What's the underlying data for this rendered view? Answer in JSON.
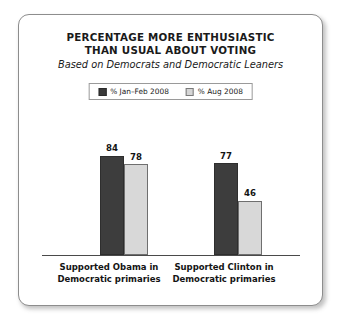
{
  "card": {
    "border_color": "#8d8d8d",
    "background": "#ffffff"
  },
  "title": {
    "line1": "PERCENTAGE MORE ENTHUSIASTIC",
    "line2": "THAN USUAL ABOUT VOTING",
    "subtitle": "Based on Democrats and Democratic Leaners"
  },
  "legend": {
    "items": [
      {
        "label": "% Jan–Feb 2008",
        "color": "#3a3a3a",
        "swatch": "dark-square-swatch"
      },
      {
        "label": "% Aug 2008",
        "color": "#d6d6d6",
        "swatch": "light-square-swatch"
      }
    ]
  },
  "chart_data": {
    "type": "bar",
    "title": "PERCENTAGE MORE ENTHUSIASTIC THAN USUAL ABOUT VOTING",
    "subtitle": "Based on Democrats and Democratic Leaners",
    "categories": [
      "Supported Obama in Democratic primaries",
      "Supported Clinton in Democratic primaries"
    ],
    "category_lines": [
      [
        "Supported Obama in",
        "Democratic primaries"
      ],
      [
        "Supported Clinton in",
        "Democratic primaries"
      ]
    ],
    "series": [
      {
        "name": "% Jan–Feb 2008",
        "color": "#3d3d3d",
        "values": [
          84,
          78
        ]
      },
      {
        "name": "% Aug 2008",
        "color": "#d8d8d8",
        "values": [
          77,
          46
        ]
      }
    ],
    "bars": [
      {
        "category_index": 0,
        "series": "% Jan–Feb 2008",
        "value": 84
      },
      {
        "category_index": 0,
        "series": "% Aug 2008",
        "value": 78
      },
      {
        "category_index": 1,
        "series": "% Jan–Feb 2008",
        "value": 77
      },
      {
        "category_index": 1,
        "series": "% Aug 2008",
        "value": 46
      }
    ],
    "value_labels": [
      "84",
      "78",
      "77",
      "46"
    ],
    "xlabel": "",
    "ylabel": "",
    "ylim": [
      0,
      100
    ],
    "grid": false,
    "legend_position": "top-center",
    "axis_line": "baseline-only",
    "units": "percent"
  }
}
